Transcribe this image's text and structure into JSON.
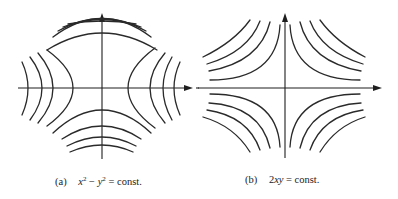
{
  "figure": {
    "panels": [
      {
        "id": "a",
        "label": "(a)",
        "equation_parts": {
          "x": "x",
          "sup1": "2",
          "minus": " − ",
          "y": "y",
          "sup2": "2",
          "rest": " = const."
        },
        "equation_text": "x² − y² = const.",
        "description": "Level curves of x² − y² (hyperbolas opening left/right and up/down) with x and y axes"
      },
      {
        "id": "b",
        "label": "(b)",
        "equation_text": "2xy = const.",
        "equation_parts": {
          "coef": "2",
          "vars": "xy",
          "rest": " = const."
        },
        "description": "Level curves of 2xy (hyperbolas in each quadrant asymptotic to the axes) with x and y axes"
      }
    ],
    "colors": {
      "stroke": "#2a2a2a",
      "background": "#ffffff"
    }
  }
}
